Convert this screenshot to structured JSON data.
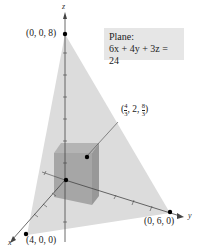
{
  "legend": {
    "title": "Plane:",
    "equation": "6x + 4y + 3z = 24"
  },
  "axes": {
    "x": "x",
    "y": "y",
    "z": "z"
  },
  "points": {
    "z_intercept": "(0, 0, 8)",
    "x_intercept": "(4, 0, 0)",
    "y_intercept": "(0, 6, 0)",
    "corner": {
      "open": "(",
      "x_num": "4",
      "x_den": "3",
      "mid": ", 2, ",
      "z_num": "8",
      "z_den": "3",
      "close": ")"
    }
  },
  "colors": {
    "plane": "#dcdcdc",
    "box_front": "#a8a8a8",
    "box_side": "#9a9a9a",
    "box_top": "#b8b8b8",
    "axis": "#444444"
  }
}
